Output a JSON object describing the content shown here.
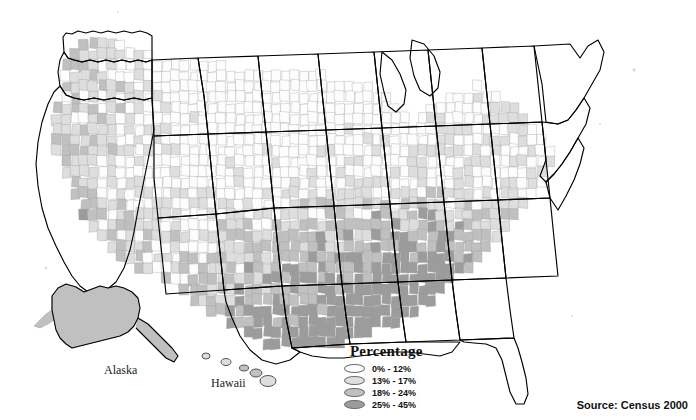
{
  "figure": {
    "type": "choropleth-map",
    "background_color": "#ffffff"
  },
  "labels": {
    "alaska": "Alaska",
    "hawaii": "Hawaii"
  },
  "legend": {
    "title": "Percentage",
    "items": [
      {
        "label": "0% - 12%",
        "color": "#fdfdfd",
        "min": 0,
        "max": 12
      },
      {
        "label": "13% - 17%",
        "color": "#dedede",
        "min": 13,
        "max": 17
      },
      {
        "label": "18% - 24%",
        "color": "#c0c0c0",
        "min": 18,
        "max": 24
      },
      {
        "label": "25% - 45%",
        "color": "#9c9c9c",
        "min": 25,
        "max": 45
      }
    ]
  },
  "source": {
    "text": "Source: Census 2000"
  },
  "chart_data": {
    "type": "heatmap",
    "title": "",
    "legend_title": "Percentage",
    "legend_position": "bottom-center",
    "classes": [
      "0% - 12%",
      "13% - 17%",
      "18% - 24%",
      "25% - 45%"
    ],
    "class_colors": [
      "#fdfdfd",
      "#dedede",
      "#c0c0c0",
      "#9c9c9c"
    ],
    "value_range": [
      0,
      45
    ],
    "regions": [
      {
        "name": "Washington",
        "class": 1
      },
      {
        "name": "Oregon",
        "class": 1
      },
      {
        "name": "California",
        "class": 2
      },
      {
        "name": "Idaho",
        "class": 0
      },
      {
        "name": "Nevada",
        "class": 1
      },
      {
        "name": "Montana",
        "class": 1
      },
      {
        "name": "Wyoming",
        "class": 1
      },
      {
        "name": "Utah",
        "class": 0
      },
      {
        "name": "Colorado",
        "class": 1
      },
      {
        "name": "Arizona",
        "class": 2
      },
      {
        "name": "New Mexico",
        "class": 2
      },
      {
        "name": "North Dakota",
        "class": 0
      },
      {
        "name": "South Dakota",
        "class": 1
      },
      {
        "name": "Nebraska",
        "class": 0
      },
      {
        "name": "Kansas",
        "class": 0
      },
      {
        "name": "Oklahoma",
        "class": 1
      },
      {
        "name": "Texas",
        "class": 1
      },
      {
        "name": "Minnesota",
        "class": 0
      },
      {
        "name": "Iowa",
        "class": 0
      },
      {
        "name": "Missouri",
        "class": 1
      },
      {
        "name": "Arkansas",
        "class": 2
      },
      {
        "name": "Louisiana",
        "class": 3
      },
      {
        "name": "Wisconsin",
        "class": 0
      },
      {
        "name": "Illinois",
        "class": 1
      },
      {
        "name": "Michigan",
        "class": 1
      },
      {
        "name": "Indiana",
        "class": 1
      },
      {
        "name": "Ohio",
        "class": 1
      },
      {
        "name": "Kentucky",
        "class": 2
      },
      {
        "name": "Tennessee",
        "class": 2
      },
      {
        "name": "Mississippi",
        "class": 3
      },
      {
        "name": "Alabama",
        "class": 3
      },
      {
        "name": "Georgia",
        "class": 3
      },
      {
        "name": "Florida",
        "class": 2
      },
      {
        "name": "South Carolina",
        "class": 3
      },
      {
        "name": "North Carolina",
        "class": 2
      },
      {
        "name": "Virginia",
        "class": 2
      },
      {
        "name": "West Virginia",
        "class": 2
      },
      {
        "name": "Maryland",
        "class": 1
      },
      {
        "name": "Delaware",
        "class": 1
      },
      {
        "name": "Pennsylvania",
        "class": 1
      },
      {
        "name": "New York",
        "class": 1
      },
      {
        "name": "New Jersey",
        "class": 1
      },
      {
        "name": "Connecticut",
        "class": 1
      },
      {
        "name": "Rhode Island",
        "class": 1
      },
      {
        "name": "Massachusetts",
        "class": 1
      },
      {
        "name": "Vermont",
        "class": 1
      },
      {
        "name": "New Hampshire",
        "class": 1
      },
      {
        "name": "Maine",
        "class": 1
      },
      {
        "name": "Alaska",
        "class": 2
      },
      {
        "name": "Hawaii",
        "class": 1
      }
    ]
  }
}
